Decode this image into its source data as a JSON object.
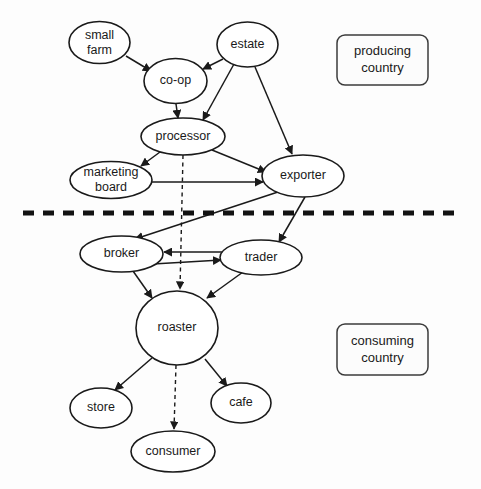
{
  "diagram": {
    "background_color": "#fdfdfd",
    "line_color": "#1a1a1a",
    "node_fill": "#ffffff",
    "nodes": [
      {
        "id": "small_farm",
        "label_line1": "small",
        "label_line2": "farm",
        "cx": 99.5,
        "cy": 42.5,
        "rx": 30.5,
        "ry": 21.0,
        "shape": "ellipse"
      },
      {
        "id": "co_op",
        "label_line1": "co-op",
        "label_line2": "",
        "cx": 175.5,
        "cy": 81.0,
        "rx": 31.5,
        "ry": 22.5,
        "shape": "ellipse"
      },
      {
        "id": "estate",
        "label_line1": "estate",
        "label_line2": "",
        "cx": 247.5,
        "cy": 44.5,
        "rx": 30.5,
        "ry": 22.5,
        "shape": "ellipse"
      },
      {
        "id": "processor",
        "label_line1": "processor",
        "label_line2": "",
        "cx": 183.0,
        "cy": 136.5,
        "rx": 42.0,
        "ry": 18.5,
        "shape": "ellipse"
      },
      {
        "id": "marketing_board",
        "label_line1": "marketing",
        "label_line2": "board",
        "cx": 111.0,
        "cy": 180.0,
        "rx": 41.0,
        "ry": 18.5,
        "shape": "ellipse"
      },
      {
        "id": "exporter",
        "label_line1": "exporter",
        "label_line2": "",
        "cx": 303.0,
        "cy": 176.0,
        "rx": 41.0,
        "ry": 21.0,
        "shape": "ellipse"
      },
      {
        "id": "broker",
        "label_line1": "broker",
        "label_line2": "",
        "cx": 121.5,
        "cy": 254.0,
        "rx": 41.5,
        "ry": 18.0,
        "shape": "ellipse"
      },
      {
        "id": "trader",
        "label_line1": "trader",
        "label_line2": "",
        "cx": 261.0,
        "cy": 257.5,
        "rx": 41.0,
        "ry": 17.5,
        "shape": "ellipse"
      },
      {
        "id": "roaster",
        "label_line1": "roaster",
        "label_line2": "",
        "cx": 177.0,
        "cy": 328.0,
        "rx": 41.0,
        "ry": 37.0,
        "shape": "ellipse"
      },
      {
        "id": "store",
        "label_line1": "store",
        "label_line2": "",
        "cx": 101.0,
        "cy": 408.0,
        "rx": 31.0,
        "ry": 20.0,
        "shape": "ellipse"
      },
      {
        "id": "cafe",
        "label_line1": "cafe",
        "label_line2": "",
        "cx": 241.0,
        "cy": 403.0,
        "rx": 30.0,
        "ry": 20.0,
        "shape": "ellipse"
      },
      {
        "id": "consumer",
        "label_line1": "consumer",
        "label_line2": "",
        "cx": 173.0,
        "cy": 451.5,
        "rx": 42.0,
        "ry": 20.5,
        "shape": "ellipse"
      }
    ],
    "edges": [
      {
        "from": "small_farm",
        "to": "co_op",
        "style": "solid",
        "d": "M 126 56 L 151 71"
      },
      {
        "from": "estate",
        "to": "co_op",
        "style": "solid",
        "d": "M 223 59 L 203 69"
      },
      {
        "from": "estate",
        "to": "processor",
        "style": "solid",
        "d": "M 234 64 L 203 120"
      },
      {
        "from": "estate",
        "to": "exporter",
        "style": "solid",
        "d": "M 255 67 L 292 154"
      },
      {
        "from": "co_op",
        "to": "processor",
        "style": "solid",
        "d": "M 176 104 L 178 118"
      },
      {
        "from": "processor",
        "to": "marketing_board",
        "style": "solid",
        "d": "M 160 152 L 141 166"
      },
      {
        "from": "processor",
        "to": "exporter",
        "style": "solid",
        "d": "M 212 150 L 266 172"
      },
      {
        "from": "marketing_board",
        "to": "exporter",
        "style": "solid",
        "d": "M 152 182 L 263 182"
      },
      {
        "from": "processor",
        "to": "roaster",
        "style": "dashed",
        "d": "M 183 155 L 180 289"
      },
      {
        "from": "exporter",
        "to": "broker",
        "style": "solid",
        "d": "M 281 191 L 135 239"
      },
      {
        "from": "exporter",
        "to": "trader",
        "style": "solid",
        "d": "M 305 197 L 279 242"
      },
      {
        "from": "trader",
        "to": "broker",
        "style": "solid",
        "d": "M 222 252 L 164 252"
      },
      {
        "from": "broker",
        "to": "trader",
        "style": "solid",
        "d": "M 153 264 L 221 260"
      },
      {
        "from": "broker",
        "to": "roaster",
        "style": "solid",
        "d": "M 133 271 L 152 298"
      },
      {
        "from": "trader",
        "to": "roaster",
        "style": "solid",
        "d": "M 243 272 L 207 298"
      },
      {
        "from": "roaster",
        "to": "store",
        "style": "solid",
        "d": "M 152 358 L 115 390"
      },
      {
        "from": "roaster",
        "to": "cafe",
        "style": "solid",
        "d": "M 205 359 L 227 386"
      },
      {
        "from": "roaster",
        "to": "consumer",
        "style": "dashed",
        "d": "M 176 365 L 174 429"
      }
    ],
    "divider": {
      "label": "country-border-divider",
      "x1": 23,
      "y1": 213,
      "x2": 458,
      "y2": 213,
      "color": "#121212"
    },
    "regions": [
      {
        "id": "producing_country",
        "label_line1": "producing",
        "label_line2": "country",
        "x": 337,
        "y": 35,
        "width": 91,
        "height": 50
      },
      {
        "id": "consuming_country",
        "label_line1": "consuming",
        "label_line2": "country",
        "x": 337,
        "y": 324,
        "width": 91,
        "height": 51
      }
    ]
  }
}
